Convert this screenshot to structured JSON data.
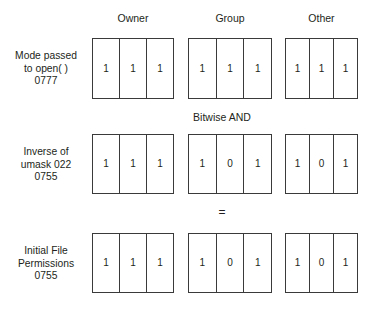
{
  "diagram": {
    "column_headers": [
      {
        "id": "owner",
        "label": "Owner"
      },
      {
        "id": "group",
        "label": "Group"
      },
      {
        "id": "other",
        "label": "Other"
      }
    ],
    "operators": {
      "and": "Bitwise AND",
      "equals": "="
    },
    "rows": [
      {
        "id": "mode-passed",
        "label_lines": [
          "Mode passed",
          "to open( )",
          "0777"
        ],
        "groups": {
          "owner": [
            "1",
            "1",
            "1"
          ],
          "group": [
            "1",
            "1",
            "1"
          ],
          "other": [
            "1",
            "1",
            "1"
          ]
        }
      },
      {
        "id": "inverse-umask",
        "label_lines": [
          "Inverse of",
          "umask 022",
          "0755"
        ],
        "groups": {
          "owner": [
            "1",
            "1",
            "1"
          ],
          "group": [
            "1",
            "0",
            "1"
          ],
          "other": [
            "1",
            "0",
            "1"
          ]
        }
      },
      {
        "id": "initial-file-permissions",
        "label_lines": [
          "Initial File",
          "Permissions",
          "0755"
        ],
        "groups": {
          "owner": [
            "1",
            "1",
            "1"
          ],
          "group": [
            "1",
            "0",
            "1"
          ],
          "other": [
            "1",
            "0",
            "1"
          ]
        }
      }
    ],
    "colors": {
      "background": "#ffffff",
      "border": "#3a3a3a",
      "text": "#231f20"
    }
  }
}
